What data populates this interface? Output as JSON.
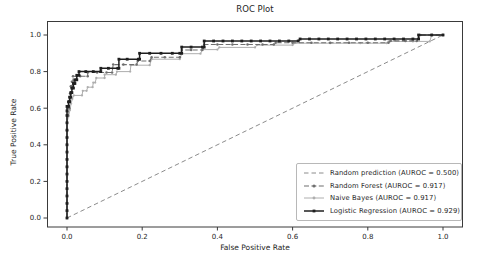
{
  "figure": {
    "title": "ROC Plot",
    "x_axis_label": "False Positive Rate",
    "y_axis_label": "True Positive Rate"
  },
  "chart_data": {
    "type": "line",
    "title": "ROC Plot",
    "xlabel": "False Positive Rate",
    "ylabel": "True Positive Rate",
    "xlim": [
      -0.05,
      1.05
    ],
    "ylim": [
      -0.05,
      1.05
    ],
    "grid": false,
    "legend_position": "lower right",
    "axis_color": "#3a3a3a",
    "text_color": "#262626",
    "x_ticks": [
      0.0,
      0.2,
      0.4,
      0.6,
      0.8,
      1.0
    ],
    "y_ticks": [
      0.0,
      0.2,
      0.4,
      0.6,
      0.8,
      1.0
    ],
    "x_tick_labels": [
      "0.0",
      "0.2",
      "0.4",
      "0.6",
      "0.8",
      "1.0"
    ],
    "y_tick_labels": [
      "0.0",
      "0.2",
      "0.4",
      "0.6",
      "0.8",
      "1.0"
    ],
    "z_order": [
      0,
      2,
      1,
      3
    ],
    "series": [
      {
        "id": "random-prediction",
        "name": "Random prediction (AUROC = 0.500)",
        "auroc": 0.5,
        "color": "#8c8c8c",
        "dash": "4.5 3",
        "width": 1,
        "marker": "none",
        "points": [
          [
            0,
            0
          ],
          [
            1,
            1
          ]
        ]
      },
      {
        "id": "random-forest",
        "name": "Random Forest (AUROC = 0.917)",
        "auroc": 0.917,
        "color": "#6f6f6f",
        "dash": "5 2.4",
        "width": 1.1,
        "marker": "dot",
        "marker_size": 1.25,
        "points": [
          [
            0,
            0
          ],
          [
            0,
            0.04
          ],
          [
            0,
            0.08
          ],
          [
            0,
            0.12
          ],
          [
            0,
            0.16
          ],
          [
            0,
            0.2
          ],
          [
            0,
            0.24
          ],
          [
            0,
            0.28
          ],
          [
            0,
            0.32
          ],
          [
            0,
            0.36
          ],
          [
            0,
            0.4
          ],
          [
            0,
            0.44
          ],
          [
            0,
            0.48
          ],
          [
            0,
            0.52
          ],
          [
            0,
            0.56
          ],
          [
            0.003,
            0.56
          ],
          [
            0.003,
            0.6
          ],
          [
            0.006,
            0.6
          ],
          [
            0.006,
            0.64
          ],
          [
            0.008,
            0.64
          ],
          [
            0.008,
            0.68
          ],
          [
            0.01,
            0.68
          ],
          [
            0.01,
            0.72
          ],
          [
            0.013,
            0.72
          ],
          [
            0.013,
            0.745
          ],
          [
            0.016,
            0.745
          ],
          [
            0.016,
            0.775
          ],
          [
            0.035,
            0.775
          ],
          [
            0.055,
            0.775
          ],
          [
            0.055,
            0.795
          ],
          [
            0.08,
            0.795
          ],
          [
            0.105,
            0.795
          ],
          [
            0.12,
            0.795
          ],
          [
            0.123,
            0.838
          ],
          [
            0.15,
            0.838
          ],
          [
            0.185,
            0.838
          ],
          [
            0.188,
            0.858
          ],
          [
            0.22,
            0.858
          ],
          [
            0.225,
            0.878
          ],
          [
            0.26,
            0.878
          ],
          [
            0.3,
            0.878
          ],
          [
            0.305,
            0.918
          ],
          [
            0.33,
            0.918
          ],
          [
            0.36,
            0.918
          ],
          [
            0.365,
            0.948
          ],
          [
            0.4,
            0.948
          ],
          [
            0.44,
            0.948
          ],
          [
            0.48,
            0.948
          ],
          [
            0.52,
            0.948
          ],
          [
            0.55,
            0.948
          ],
          [
            0.555,
            0.958
          ],
          [
            0.6,
            0.958
          ],
          [
            0.65,
            0.958
          ],
          [
            0.7,
            0.958
          ],
          [
            0.75,
            0.958
          ],
          [
            0.8,
            0.958
          ],
          [
            0.855,
            0.958
          ],
          [
            0.86,
            0.968
          ],
          [
            0.9,
            0.968
          ],
          [
            0.93,
            0.968
          ],
          [
            0.94,
            1.0
          ],
          [
            1,
            1
          ]
        ]
      },
      {
        "id": "naive-bayes",
        "name": "Naive Bayes (AUROC = 0.917)",
        "auroc": 0.917,
        "color": "#aeaeae",
        "dash": "",
        "width": 1,
        "marker": "dot",
        "marker_size": 1.15,
        "points": [
          [
            0,
            0
          ],
          [
            0,
            0.045
          ],
          [
            0,
            0.09
          ],
          [
            0,
            0.135
          ],
          [
            0,
            0.18
          ],
          [
            0,
            0.225
          ],
          [
            0,
            0.27
          ],
          [
            0,
            0.315
          ],
          [
            0,
            0.36
          ],
          [
            0,
            0.405
          ],
          [
            0,
            0.45
          ],
          [
            0,
            0.49
          ],
          [
            0,
            0.52
          ],
          [
            0.004,
            0.555
          ],
          [
            0.008,
            0.59
          ],
          [
            0.011,
            0.625
          ],
          [
            0.014,
            0.65
          ],
          [
            0.018,
            0.67
          ],
          [
            0.04,
            0.67
          ],
          [
            0.042,
            0.695
          ],
          [
            0.052,
            0.695
          ],
          [
            0.055,
            0.715
          ],
          [
            0.068,
            0.715
          ],
          [
            0.07,
            0.74
          ],
          [
            0.075,
            0.74
          ],
          [
            0.078,
            0.765
          ],
          [
            0.1,
            0.765
          ],
          [
            0.1,
            0.783
          ],
          [
            0.13,
            0.783
          ],
          [
            0.133,
            0.8
          ],
          [
            0.168,
            0.8
          ],
          [
            0.17,
            0.835
          ],
          [
            0.22,
            0.835
          ],
          [
            0.225,
            0.868
          ],
          [
            0.3,
            0.868
          ],
          [
            0.305,
            0.898
          ],
          [
            0.355,
            0.898
          ],
          [
            0.36,
            0.92
          ],
          [
            0.4,
            0.92
          ],
          [
            0.405,
            0.932
          ],
          [
            0.5,
            0.932
          ],
          [
            0.505,
            0.945
          ],
          [
            0.6,
            0.945
          ],
          [
            0.605,
            0.955
          ],
          [
            0.7,
            0.955
          ],
          [
            0.78,
            0.955
          ],
          [
            0.85,
            0.955
          ],
          [
            0.855,
            0.965
          ],
          [
            0.92,
            0.965
          ],
          [
            0.965,
            0.965
          ],
          [
            0.97,
            1.0
          ],
          [
            1,
            1
          ]
        ]
      },
      {
        "id": "logistic-regression",
        "name": "Logistic Regression (AUROC = 0.929)",
        "auroc": 0.929,
        "color": "#1f1f1f",
        "dash": "",
        "width": 1.5,
        "marker": "square",
        "marker_size": 2.8,
        "points": [
          [
            0,
            0
          ],
          [
            0,
            0.04
          ],
          [
            0,
            0.08
          ],
          [
            0,
            0.12
          ],
          [
            0,
            0.16
          ],
          [
            0,
            0.2
          ],
          [
            0,
            0.24
          ],
          [
            0,
            0.28
          ],
          [
            0,
            0.32
          ],
          [
            0,
            0.36
          ],
          [
            0,
            0.4
          ],
          [
            0,
            0.44
          ],
          [
            0,
            0.48
          ],
          [
            0,
            0.52
          ],
          [
            0,
            0.56
          ],
          [
            0,
            0.585
          ],
          [
            0,
            0.61
          ],
          [
            0.004,
            0.61
          ],
          [
            0.004,
            0.635
          ],
          [
            0.007,
            0.635
          ],
          [
            0.007,
            0.66
          ],
          [
            0.01,
            0.66
          ],
          [
            0.01,
            0.685
          ],
          [
            0.013,
            0.685
          ],
          [
            0.013,
            0.71
          ],
          [
            0.017,
            0.71
          ],
          [
            0.017,
            0.735
          ],
          [
            0.021,
            0.735
          ],
          [
            0.021,
            0.755
          ],
          [
            0.026,
            0.755
          ],
          [
            0.026,
            0.78
          ],
          [
            0.032,
            0.78
          ],
          [
            0.032,
            0.8
          ],
          [
            0.05,
            0.8
          ],
          [
            0.07,
            0.8
          ],
          [
            0.09,
            0.8
          ],
          [
            0.09,
            0.818
          ],
          [
            0.11,
            0.818
          ],
          [
            0.135,
            0.818
          ],
          [
            0.138,
            0.818
          ],
          [
            0.138,
            0.868
          ],
          [
            0.16,
            0.868
          ],
          [
            0.19,
            0.868
          ],
          [
            0.193,
            0.868
          ],
          [
            0.193,
            0.9
          ],
          [
            0.22,
            0.9
          ],
          [
            0.25,
            0.9
          ],
          [
            0.28,
            0.9
          ],
          [
            0.3,
            0.9
          ],
          [
            0.305,
            0.9
          ],
          [
            0.305,
            0.934
          ],
          [
            0.33,
            0.934
          ],
          [
            0.36,
            0.934
          ],
          [
            0.365,
            0.934
          ],
          [
            0.365,
            0.967
          ],
          [
            0.39,
            0.967
          ],
          [
            0.415,
            0.967
          ],
          [
            0.44,
            0.967
          ],
          [
            0.465,
            0.967
          ],
          [
            0.49,
            0.967
          ],
          [
            0.515,
            0.967
          ],
          [
            0.54,
            0.967
          ],
          [
            0.565,
            0.967
          ],
          [
            0.59,
            0.967
          ],
          [
            0.615,
            0.967
          ],
          [
            0.62,
            0.978
          ],
          [
            0.645,
            0.978
          ],
          [
            0.67,
            0.978
          ],
          [
            0.695,
            0.978
          ],
          [
            0.72,
            0.978
          ],
          [
            0.745,
            0.978
          ],
          [
            0.77,
            0.978
          ],
          [
            0.795,
            0.978
          ],
          [
            0.82,
            0.978
          ],
          [
            0.845,
            0.978
          ],
          [
            0.87,
            0.978
          ],
          [
            0.895,
            0.978
          ],
          [
            0.92,
            0.978
          ],
          [
            0.935,
            0.978
          ],
          [
            0.935,
            1.0
          ],
          [
            0.97,
            1.0
          ],
          [
            1,
            1
          ]
        ]
      }
    ]
  }
}
